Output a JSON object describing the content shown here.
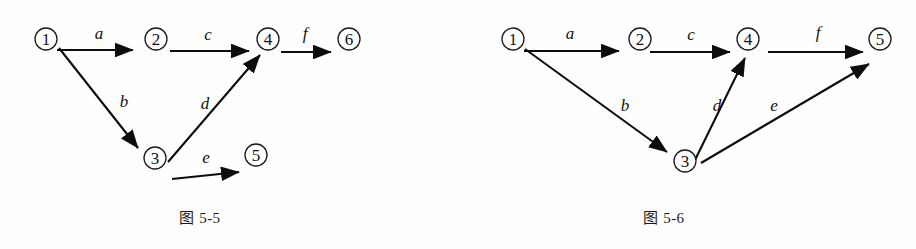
{
  "page": {
    "background_color": "#fefefe",
    "ink_color": "#0d0d0d"
  },
  "figures": [
    {
      "id": "figure-5-5",
      "caption": "图 5-5",
      "nodes": [
        {
          "id": "n1",
          "label": "①",
          "text": "1",
          "cx": 46,
          "cy": 39,
          "r": 11
        },
        {
          "id": "n2",
          "label": "②",
          "text": "2",
          "cx": 156,
          "cy": 39,
          "r": 11
        },
        {
          "id": "n4",
          "label": "④",
          "text": "4",
          "cx": 268,
          "cy": 39,
          "r": 11
        },
        {
          "id": "n6",
          "label": "⑥",
          "text": "6",
          "cx": 349,
          "cy": 39,
          "r": 11
        },
        {
          "id": "n3",
          "label": "③",
          "text": "3",
          "cx": 155,
          "cy": 158,
          "r": 11
        },
        {
          "id": "n5",
          "label": "⑤",
          "text": "5",
          "cx": 256,
          "cy": 155,
          "r": 11
        }
      ],
      "edges": [
        {
          "id": "e-a",
          "label": "a",
          "from": "n1",
          "to": "n2",
          "x1": 57,
          "y1": 50,
          "x2": 138,
          "y2": 50,
          "lx": 99,
          "ly": 33
        },
        {
          "id": "e-c",
          "label": "c",
          "from": "n2",
          "to": "n4",
          "x1": 170,
          "y1": 51,
          "x2": 253,
          "y2": 51,
          "lx": 208,
          "ly": 34
        },
        {
          "id": "e-f",
          "label": "f",
          "from": "n4",
          "to": "n6",
          "x1": 280,
          "y1": 52,
          "x2": 334,
          "y2": 52,
          "lx": 305,
          "ly": 33
        },
        {
          "id": "e-b",
          "label": "b",
          "from": "n1",
          "to": "n3",
          "x1": 59,
          "y1": 48,
          "x2": 141,
          "y2": 151,
          "lx": 124,
          "ly": 101
        },
        {
          "id": "e-d",
          "label": "d",
          "from": "n3",
          "to": "n4",
          "x1": 168,
          "y1": 161,
          "x2": 258,
          "y2": 56,
          "lx": 205,
          "ly": 103
        },
        {
          "id": "e-e",
          "label": "e",
          "from": "n3",
          "to": "n5",
          "x1": 172,
          "y1": 179,
          "x2": 243,
          "y2": 172,
          "lx": 206,
          "ly": 156
        }
      ]
    },
    {
      "id": "figure-5-6",
      "caption": "图 5-6",
      "nodes": [
        {
          "id": "m1",
          "label": "①",
          "text": "1",
          "cx": 55,
          "cy": 39,
          "r": 11
        },
        {
          "id": "m2",
          "label": "②",
          "text": "2",
          "cx": 182,
          "cy": 39,
          "r": 11
        },
        {
          "id": "m4",
          "label": "④",
          "text": "4",
          "cx": 290,
          "cy": 39,
          "r": 11
        },
        {
          "id": "m5",
          "label": "⑤",
          "text": "5",
          "cx": 422,
          "cy": 39,
          "r": 11
        },
        {
          "id": "m3",
          "label": "③",
          "text": "3",
          "cx": 227,
          "cy": 161,
          "r": 11
        }
      ],
      "edges": [
        {
          "id": "f-a",
          "label": "a",
          "from": "m1",
          "to": "m2",
          "x1": 66,
          "y1": 51,
          "x2": 165,
          "y2": 51,
          "lx": 112,
          "ly": 33
        },
        {
          "id": "f-c",
          "label": "c",
          "from": "m2",
          "to": "m4",
          "x1": 192,
          "y1": 52,
          "x2": 275,
          "y2": 52,
          "lx": 233,
          "ly": 34
        },
        {
          "id": "f-f",
          "label": "f",
          "from": "m4",
          "to": "m5",
          "x1": 310,
          "y1": 52,
          "x2": 408,
          "y2": 52,
          "lx": 360,
          "ly": 32
        },
        {
          "id": "f-b",
          "label": "b",
          "from": "m1",
          "to": "m3",
          "x1": 67,
          "y1": 49,
          "x2": 212,
          "y2": 154,
          "lx": 167,
          "ly": 105
        },
        {
          "id": "f-d",
          "label": "d",
          "from": "m3",
          "to": "m4",
          "x1": 237,
          "y1": 160,
          "x2": 285,
          "y2": 60,
          "lx": 259,
          "ly": 105
        },
        {
          "id": "f-e",
          "label": "e",
          "from": "m3",
          "to": "m5",
          "x1": 243,
          "y1": 163,
          "x2": 414,
          "y2": 62,
          "lx": 315,
          "ly": 105
        }
      ]
    }
  ]
}
